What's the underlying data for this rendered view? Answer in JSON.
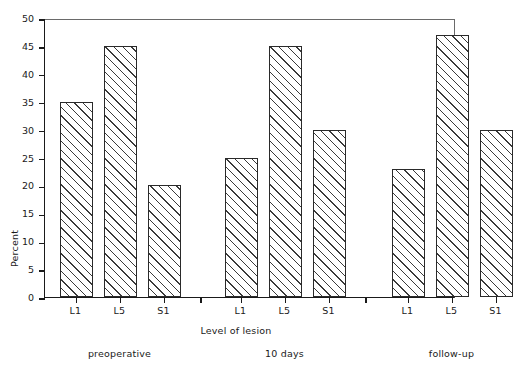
{
  "chart_data": {
    "type": "bar",
    "title": "",
    "subtitle": "",
    "xlabel": "Level of lesion",
    "ylabel": "Percent",
    "ylim": [
      0,
      50
    ],
    "yticks": [
      0,
      5,
      10,
      15,
      20,
      25,
      30,
      35,
      40,
      45,
      50
    ],
    "grid": false,
    "legend": "none",
    "categories": [
      "L1",
      "L5",
      "S1"
    ],
    "group_labels": [
      "preoperative",
      "10 days",
      "follow-up"
    ],
    "series": [
      {
        "name": "preoperative",
        "values": [
          35,
          45,
          20
        ]
      },
      {
        "name": "10 days",
        "values": [
          25,
          45,
          30
        ]
      },
      {
        "name": "follow-up",
        "values": [
          23,
          47,
          30
        ]
      }
    ],
    "bars": [
      {
        "group": "preoperative",
        "category": "L1",
        "value": 35
      },
      {
        "group": "preoperative",
        "category": "L5",
        "value": 45
      },
      {
        "group": "preoperative",
        "category": "S1",
        "value": 20
      },
      {
        "group": "10 days",
        "category": "L1",
        "value": 25
      },
      {
        "group": "10 days",
        "category": "L5",
        "value": 45
      },
      {
        "group": "10 days",
        "category": "S1",
        "value": 30
      },
      {
        "group": "follow-up",
        "category": "L1",
        "value": 23
      },
      {
        "group": "follow-up",
        "category": "L5",
        "value": 47
      },
      {
        "group": "follow-up",
        "category": "S1",
        "value": 30
      }
    ],
    "colors": {
      "bar_fill": "#ffffff",
      "bar_edge": "#2a2a2a",
      "hatch": "#3a3a3a",
      "axis": "#1a1a1a",
      "frame": "#6a6a6a",
      "background": "#ffffff"
    },
    "bar_style": "diagonal-hatch-forward"
  }
}
